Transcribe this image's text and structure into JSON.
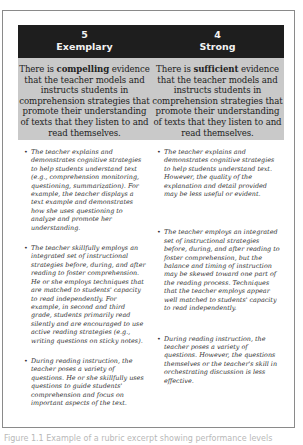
{
  "rubric": {
    "columns": [
      {
        "score": "5",
        "level": "Exemplary",
        "summary_pre": "There is ",
        "summary_bold": "compelling",
        "summary_post": " evidence that the teacher models and instructs students in comprehension strategies that promote their understanding of texts that they listen to and read themselves.",
        "bullets": [
          "The teacher explains and demonstrates cognitive strategies to help students understand text (e.g., comprehension monitoring, questioning, summarization). For example, the teacher displays a text example and demonstrates how she uses questioning to analyze and promote her understanding.",
          "The teacher skillfully employs an integrated set of instructional strategies before, during, and after reading to foster comprehension. He or she employs techniques that are matched to students' capacity to read independently. For example, in second and third grade, students primarily read silently and are encouraged to use active reading strategies (e.g., writing questions on sticky notes).",
          "During reading instruction, the teacher poses a variety of questions. He or she skillfully uses questions to guide students' comprehension and focus on important aspects of the text."
        ]
      },
      {
        "score": "4",
        "level": "Strong",
        "summary_pre": "There is ",
        "summary_bold": "sufficient",
        "summary_post": " evidence that the teacher models and instructs students in comprehension strategies that promote their understanding of texts that they listen to and read themselves.",
        "bullets": [
          "The teacher explains and demonstrates cognitive strategies to help students understand text. However, the quality of the explanation and detail provided may be less useful or evident.",
          "The teacher employs an integrated set of instructional strategies before, during, and after reading to foster comprehension, but the balance and timing of instruction may be skewed toward one part of the reading process. Techniques that the teacher employs appear well matched to students' capacity to read independently.",
          "During reading instruction, the teacher poses a variety of questions. However, the questions themselves or the teacher's skill in orchestrating discussion is less effective."
        ]
      }
    ],
    "bullet_glyph": "•"
  },
  "caption": "Figure 1.1  Example of a rubric excerpt showing performance levels"
}
